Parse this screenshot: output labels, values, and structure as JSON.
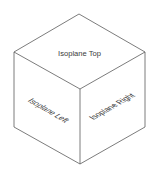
{
  "diagram": {
    "line_color": "#5a5a5a",
    "text_color": "#3a3a3a",
    "faces": {
      "top": {
        "label": "Isoplane Top"
      },
      "left": {
        "label": "Isoplane Left"
      },
      "right": {
        "label": "Isoplane Right"
      }
    },
    "vertices": {
      "top": [
        79,
        14
      ],
      "upper_left": [
        14,
        52
      ],
      "upper_right": [
        145,
        52
      ],
      "center": [
        80,
        89
      ],
      "lower_left": [
        14,
        127
      ],
      "lower_right": [
        145,
        127
      ],
      "bottom": [
        80,
        164
      ]
    }
  }
}
